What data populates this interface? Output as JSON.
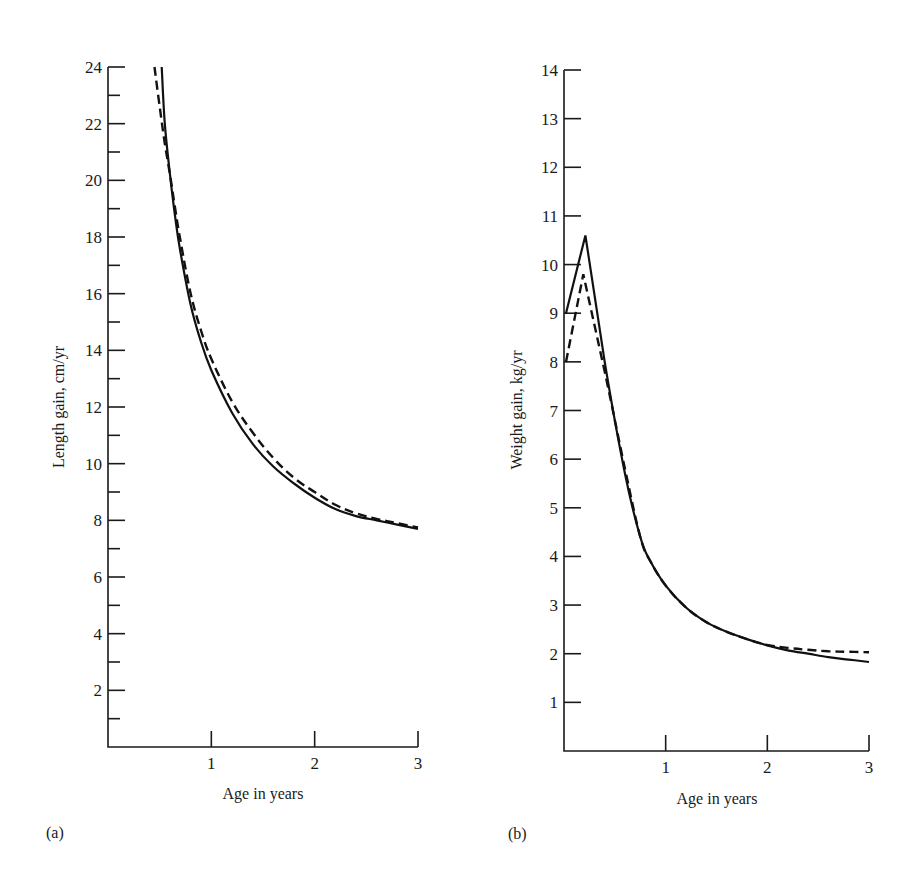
{
  "figure": {
    "panel_a_label": "(a)",
    "panel_b_label": "(b)"
  },
  "chart_data": [
    {
      "type": "line",
      "panel": "(a)",
      "title": "",
      "xlabel": "Age in years",
      "ylabel": "Length gain, cm/yr",
      "xlim": [
        0,
        3
      ],
      "ylim": [
        0,
        24
      ],
      "x_ticks": [
        1,
        2,
        3
      ],
      "x_tick_labels": [
        "1",
        "2",
        "3"
      ],
      "y_ticks": [
        2,
        4,
        6,
        8,
        10,
        12,
        14,
        16,
        18,
        20,
        22,
        24
      ],
      "y_tick_labels": [
        "2",
        "4",
        "6",
        "8",
        "10",
        "12",
        "14",
        "16",
        "18",
        "20",
        "22",
        "24"
      ],
      "y_minor_ticks": [
        1,
        3,
        5,
        7,
        9,
        11,
        13,
        15,
        17,
        19,
        21,
        23
      ],
      "grid": false,
      "legend": null,
      "series": [
        {
          "name": "solid",
          "style": "solid",
          "x": [
            0.52,
            0.55,
            0.6,
            0.65,
            0.7,
            0.8,
            0.9,
            1.0,
            1.2,
            1.4,
            1.6,
            1.8,
            2.0,
            2.2,
            2.4,
            2.6,
            2.8,
            3.0
          ],
          "y": [
            24.0,
            22.0,
            20.2,
            18.7,
            17.5,
            15.6,
            14.3,
            13.3,
            11.8,
            10.7,
            9.9,
            9.3,
            8.8,
            8.4,
            8.15,
            8.0,
            7.85,
            7.7
          ]
        },
        {
          "name": "dashed",
          "style": "dashed",
          "x": [
            0.45,
            0.5,
            0.55,
            0.6,
            0.65,
            0.7,
            0.8,
            0.9,
            1.0,
            1.2,
            1.4,
            1.6,
            1.8,
            2.0,
            2.2,
            2.4,
            2.6,
            2.8,
            3.0
          ],
          "y": [
            24.0,
            22.6,
            21.3,
            20.2,
            19.0,
            17.9,
            16.0,
            14.7,
            13.7,
            12.2,
            11.1,
            10.2,
            9.5,
            9.0,
            8.55,
            8.25,
            8.05,
            7.9,
            7.75
          ]
        }
      ]
    },
    {
      "type": "line",
      "panel": "(b)",
      "title": "",
      "xlabel": "Age in years",
      "ylabel": "Weight gain, kg/yr",
      "xlim": [
        0,
        3
      ],
      "ylim": [
        0,
        14
      ],
      "x_ticks": [
        1,
        2,
        3
      ],
      "x_tick_labels": [
        "1",
        "2",
        "3"
      ],
      "y_ticks": [
        1,
        2,
        3,
        4,
        5,
        6,
        7,
        8,
        9,
        10,
        11,
        12,
        13,
        14
      ],
      "y_tick_labels": [
        "1",
        "2",
        "3",
        "4",
        "5",
        "6",
        "7",
        "8",
        "9",
        "10",
        "11",
        "12",
        "13",
        "14"
      ],
      "grid": false,
      "legend": null,
      "series": [
        {
          "name": "solid",
          "style": "solid",
          "x": [
            0.02,
            0.21,
            0.4,
            0.6,
            0.75,
            0.85,
            1.0,
            1.2,
            1.4,
            1.6,
            1.8,
            2.0,
            2.2,
            2.4,
            2.6,
            2.8,
            3.0
          ],
          "y": [
            9.0,
            10.6,
            8.0,
            5.7,
            4.4,
            3.9,
            3.4,
            2.95,
            2.65,
            2.45,
            2.3,
            2.17,
            2.07,
            2.0,
            1.93,
            1.88,
            1.83
          ]
        },
        {
          "name": "dashed",
          "style": "dashed",
          "x": [
            0.02,
            0.19,
            0.4,
            0.6,
            0.75,
            0.85,
            1.0,
            1.2,
            1.4,
            1.6,
            1.8,
            2.0,
            2.2,
            2.4,
            2.6,
            2.8,
            3.0
          ],
          "y": [
            8.0,
            9.8,
            7.8,
            5.8,
            4.4,
            3.9,
            3.4,
            2.95,
            2.65,
            2.45,
            2.3,
            2.18,
            2.12,
            2.08,
            2.05,
            2.04,
            2.03
          ]
        }
      ]
    }
  ]
}
